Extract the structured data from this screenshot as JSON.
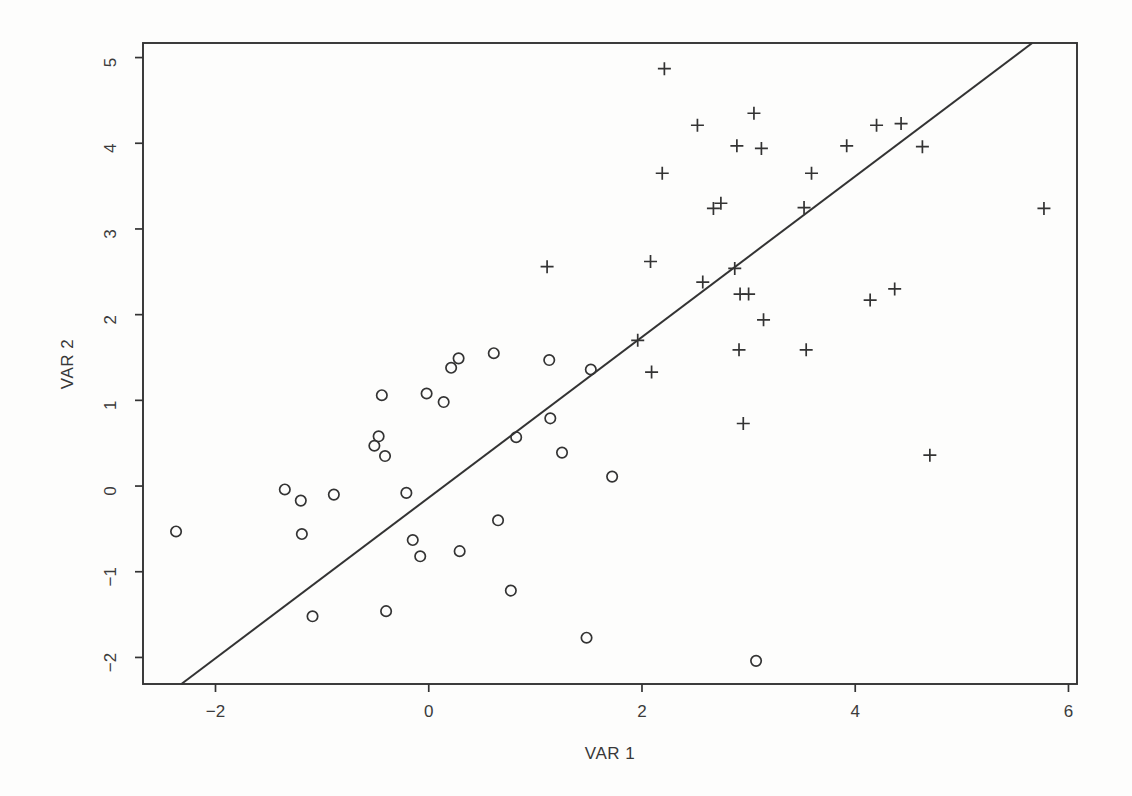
{
  "colors": {
    "ink": "#333333",
    "paper": "#fdfdfc",
    "tick_text": "#3b3b3b"
  },
  "chart_data": {
    "type": "scatter",
    "title": "",
    "xlabel": "VAR 1",
    "ylabel": "VAR 2",
    "xlim": [
      -2.68,
      6.08
    ],
    "ylim": [
      -2.31,
      5.17
    ],
    "x_ticks": [
      -2,
      0,
      2,
      4,
      6
    ],
    "y_ticks": [
      -2,
      -1,
      0,
      1,
      2,
      3,
      4,
      5
    ],
    "grid": false,
    "legend_position": "none",
    "series": [
      {
        "name": "group-1-circles",
        "marker": "o",
        "points": [
          [
            -2.37,
            -0.53
          ],
          [
            -1.35,
            -0.04
          ],
          [
            -1.2,
            -0.17
          ],
          [
            -1.19,
            -0.56
          ],
          [
            -1.09,
            -1.52
          ],
          [
            -0.89,
            -0.1
          ],
          [
            -0.51,
            0.47
          ],
          [
            -0.47,
            0.58
          ],
          [
            -0.44,
            1.06
          ],
          [
            -0.41,
            0.35
          ],
          [
            -0.4,
            -1.46
          ],
          [
            -0.21,
            -0.08
          ],
          [
            -0.15,
            -0.63
          ],
          [
            -0.08,
            -0.82
          ],
          [
            -0.02,
            1.08
          ],
          [
            0.14,
            0.98
          ],
          [
            0.21,
            1.38
          ],
          [
            0.28,
            1.49
          ],
          [
            0.29,
            -0.76
          ],
          [
            0.61,
            1.55
          ],
          [
            0.65,
            -0.4
          ],
          [
            0.77,
            -1.22
          ],
          [
            0.82,
            0.57
          ],
          [
            1.13,
            1.47
          ],
          [
            1.14,
            0.79
          ],
          [
            1.25,
            0.39
          ],
          [
            1.48,
            -1.77
          ],
          [
            1.52,
            1.36
          ],
          [
            1.72,
            0.11
          ],
          [
            3.07,
            -2.04
          ]
        ]
      },
      {
        "name": "group-2-pluses",
        "marker": "+",
        "points": [
          [
            1.11,
            2.56
          ],
          [
            1.96,
            1.7
          ],
          [
            2.08,
            2.62
          ],
          [
            2.09,
            1.33
          ],
          [
            2.19,
            3.65
          ],
          [
            2.21,
            4.87
          ],
          [
            2.52,
            4.21
          ],
          [
            2.57,
            2.38
          ],
          [
            2.67,
            3.24
          ],
          [
            2.74,
            3.3
          ],
          [
            2.87,
            2.54
          ],
          [
            2.89,
            3.97
          ],
          [
            2.91,
            1.59
          ],
          [
            2.92,
            2.24
          ],
          [
            2.95,
            0.73
          ],
          [
            3.0,
            2.24
          ],
          [
            3.05,
            4.35
          ],
          [
            3.12,
            3.94
          ],
          [
            3.14,
            1.94
          ],
          [
            3.52,
            3.25
          ],
          [
            3.54,
            1.59
          ],
          [
            3.59,
            3.65
          ],
          [
            3.92,
            3.97
          ],
          [
            4.14,
            2.17
          ],
          [
            4.2,
            4.21
          ],
          [
            4.37,
            2.3
          ],
          [
            4.43,
            4.23
          ],
          [
            4.63,
            3.96
          ],
          [
            4.7,
            0.36
          ],
          [
            5.77,
            3.24
          ]
        ]
      }
    ],
    "fit_line": {
      "x1": -2.32,
      "y1": -2.31,
      "x2": 5.66,
      "y2": 5.17
    }
  }
}
